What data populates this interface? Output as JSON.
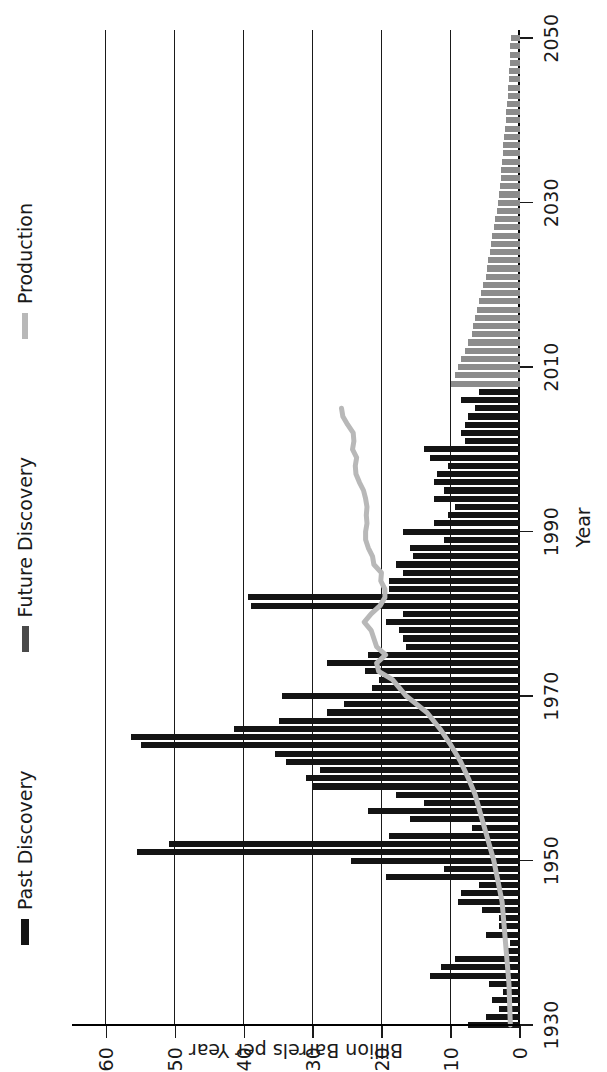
{
  "chart_data": {
    "type": "bar",
    "title": "",
    "subtitle": "",
    "orientation": "horizontal-rotated",
    "xlabel": "Year",
    "ylabel": "Billion Barrels per Year",
    "xlim": [
      1930,
      2051
    ],
    "ylim": [
      0,
      65
    ],
    "grid": true,
    "grid_axis": "value",
    "legend_position": "top-left",
    "x_ticks": [
      1930,
      1950,
      1970,
      1990,
      2010,
      2030,
      2050
    ],
    "y_ticks": [
      0,
      10,
      20,
      30,
      40,
      50,
      60
    ],
    "colors": {
      "past_discovery": "#141414",
      "future_discovery": "#8c8c8c",
      "production": "#b8b8b8",
      "axis": "#1a1a1a",
      "background": "#ffffff"
    },
    "legend": [
      {
        "label": "Past Discovery",
        "color": "#141414",
        "marker": "thick-line"
      },
      {
        "label": "Future Discovery",
        "color": "#4a4a4a",
        "marker": "thick-line"
      },
      {
        "label": "Production",
        "color": "#b8b8b8",
        "marker": "thick-line"
      }
    ],
    "series": [
      {
        "name": "Past Discovery",
        "type": "bar",
        "color": "#141414",
        "x": [
          1930,
          1931,
          1932,
          1933,
          1934,
          1935,
          1936,
          1937,
          1938,
          1939,
          1940,
          1941,
          1942,
          1943,
          1944,
          1945,
          1946,
          1947,
          1948,
          1949,
          1950,
          1951,
          1952,
          1953,
          1954,
          1955,
          1956,
          1957,
          1958,
          1959,
          1960,
          1961,
          1962,
          1963,
          1964,
          1965,
          1966,
          1967,
          1968,
          1969,
          1970,
          1971,
          1972,
          1973,
          1974,
          1975,
          1976,
          1977,
          1978,
          1979,
          1980,
          1981,
          1982,
          1983,
          1984,
          1985,
          1986,
          1987,
          1988,
          1989,
          1990,
          1991,
          1992,
          1993,
          1994,
          1995,
          1996,
          1997,
          1998,
          1999,
          2000,
          2001,
          2002,
          2003,
          2004,
          2005,
          2006,
          2007
        ],
        "values": [
          7.5,
          5.0,
          3.0,
          4.0,
          2.5,
          4.5,
          13.0,
          11.5,
          9.5,
          2.0,
          1.5,
          5.0,
          3.0,
          3.0,
          5.5,
          9.0,
          8.5,
          6.0,
          19.5,
          11.0,
          24.5,
          55.5,
          51.0,
          19.0,
          7.0,
          16.0,
          22.0,
          14.0,
          18.0,
          30.0,
          31.0,
          29.0,
          34.0,
          35.5,
          55.0,
          56.5,
          41.5,
          35.0,
          28.0,
          25.5,
          34.5,
          21.5,
          20.5,
          22.5,
          28.0,
          22.0,
          16.5,
          17.0,
          17.5,
          19.5,
          17.0,
          39.0,
          39.5,
          19.0,
          19.0,
          17.0,
          18.0,
          15.5,
          16.0,
          11.0,
          17.0,
          12.5,
          10.5,
          9.5,
          12.5,
          11.0,
          12.5,
          12.0,
          10.5,
          13.0,
          14.0,
          8.0,
          8.5,
          8.0,
          7.5,
          6.5,
          8.5,
          6.0
        ]
      },
      {
        "name": "Future Discovery",
        "type": "bar",
        "color": "#8c8c8c",
        "x": [
          2008,
          2009,
          2010,
          2011,
          2012,
          2013,
          2014,
          2015,
          2016,
          2017,
          2018,
          2019,
          2020,
          2021,
          2022,
          2023,
          2024,
          2025,
          2026,
          2027,
          2028,
          2029,
          2030,
          2031,
          2032,
          2033,
          2034,
          2035,
          2036,
          2037,
          2038,
          2039,
          2040,
          2041,
          2042,
          2043,
          2044,
          2045,
          2046,
          2047,
          2048,
          2049,
          2050
        ],
        "values": [
          10.0,
          9.5,
          9.0,
          8.5,
          8.0,
          7.5,
          7.0,
          6.8,
          6.5,
          6.2,
          5.9,
          5.6,
          5.3,
          5.0,
          4.8,
          4.6,
          4.4,
          4.2,
          4.0,
          3.8,
          3.6,
          3.4,
          3.2,
          3.0,
          2.9,
          2.8,
          2.7,
          2.6,
          2.5,
          2.4,
          2.3,
          2.2,
          2.1,
          2.0,
          1.9,
          1.8,
          1.7,
          1.6,
          1.55,
          1.5,
          1.45,
          1.4,
          1.35
        ]
      },
      {
        "name": "Production",
        "type": "line",
        "color": "#b8b8b8",
        "x": [
          1930,
          1935,
          1940,
          1945,
          1950,
          1955,
          1958,
          1960,
          1962,
          1964,
          1966,
          1968,
          1970,
          1971,
          1972,
          1973,
          1974,
          1975,
          1976,
          1977,
          1978,
          1979,
          1980,
          1981,
          1982,
          1983,
          1984,
          1985,
          1986,
          1987,
          1988,
          1989,
          1990,
          1991,
          1992,
          1993,
          1994,
          1995,
          1996,
          1997,
          1998,
          1999,
          2000,
          2001,
          2002,
          2003,
          2004,
          2005
        ],
        "values": [
          1.4,
          1.6,
          2.1,
          2.6,
          3.8,
          5.5,
          6.5,
          7.5,
          8.6,
          10.0,
          11.6,
          13.5,
          16.5,
          17.5,
          18.5,
          20.5,
          20.8,
          19.5,
          20.8,
          21.2,
          21.6,
          22.6,
          21.6,
          20.3,
          19.6,
          19.6,
          20.2,
          20.1,
          21.2,
          21.4,
          22.0,
          22.4,
          22.4,
          22.2,
          22.3,
          22.2,
          22.4,
          22.7,
          23.3,
          23.8,
          23.9,
          23.7,
          24.3,
          24.1,
          24.2,
          25.0,
          25.7,
          25.9
        ]
      }
    ]
  },
  "axes": {
    "year_axis": {
      "title": "Year",
      "ticks": [
        "1930",
        "1950",
        "1970",
        "1990",
        "2010",
        "2030",
        "2050"
      ]
    },
    "value_axis": {
      "title": "Billion Barrels per Year",
      "ticks": [
        "0",
        "10",
        "20",
        "30",
        "40",
        "50",
        "60"
      ]
    }
  },
  "legend": {
    "entries": [
      {
        "label": "Past Discovery"
      },
      {
        "label": "Future Discovery"
      },
      {
        "label": "Production"
      }
    ]
  }
}
